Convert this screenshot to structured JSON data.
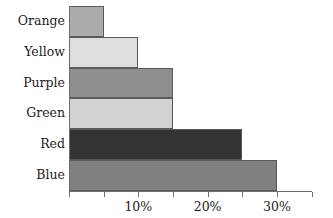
{
  "chart_data": {
    "type": "bar",
    "orientation": "horizontal",
    "title": "",
    "xlabel": "",
    "ylabel": "",
    "categories": [
      "Orange",
      "Yellow",
      "Purple",
      "Green",
      "Red",
      "Blue"
    ],
    "values": [
      5,
      10,
      15,
      15,
      25,
      30
    ],
    "value_unit": "%",
    "xlim": [
      0,
      35
    ],
    "xticks": [
      0,
      5,
      10,
      15,
      20,
      25,
      30,
      35
    ],
    "xtick_labels": [
      "",
      "",
      "10%",
      "",
      "20%",
      "",
      "30%",
      ""
    ],
    "labeled_ticks": [
      "10%",
      "20%",
      "30%"
    ],
    "grid": false,
    "legend": false,
    "bar_colors": [
      "#ABABAB",
      "#DEDEDE",
      "#8E8E8E",
      "#D2D2D2",
      "#333333",
      "#808080"
    ],
    "bar_border_color": "#5A5A5A",
    "axis_color": "#6E6E6E",
    "background": "#FFFFFF",
    "bars": [
      {
        "label": "Orange",
        "value": 5,
        "value_text": "5%",
        "color": "#ABABAB"
      },
      {
        "label": "Yellow",
        "value": 10,
        "value_text": "10%",
        "color": "#DEDEDE"
      },
      {
        "label": "Purple",
        "value": 15,
        "value_text": "15%",
        "color": "#8E8E8E"
      },
      {
        "label": "Green",
        "value": 15,
        "value_text": "15%",
        "color": "#D2D2D2"
      },
      {
        "label": "Red",
        "value": 25,
        "value_text": "25%",
        "color": "#333333"
      },
      {
        "label": "Blue",
        "value": 30,
        "value_text": "30%",
        "color": "#808080"
      }
    ]
  }
}
